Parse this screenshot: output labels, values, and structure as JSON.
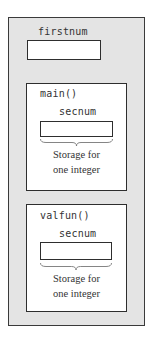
{
  "global_scope": {
    "variable": "firstnum"
  },
  "functions": [
    {
      "name": "main()",
      "variable": "secnum",
      "caption_line1": "Storage for",
      "caption_line2": "one integer"
    },
    {
      "name": "valfun()",
      "variable": "secnum",
      "caption_line1": "Storage for",
      "caption_line2": "one integer"
    }
  ],
  "colors": {
    "global_background": "#e4e4e4",
    "function_background": "#ffffff",
    "border": "#2e2e2e"
  }
}
